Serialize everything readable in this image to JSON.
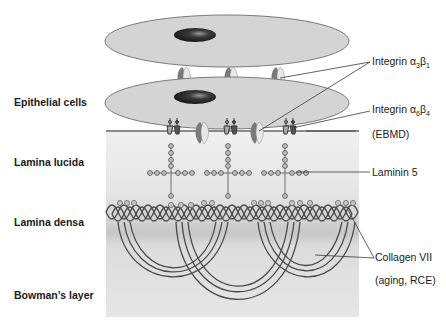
{
  "layers": {
    "epithelial": "Epithelial cells",
    "lucida": "Lamina lucida",
    "densa": "Lamina densa",
    "bowman": "Bowman’s layer"
  },
  "callouts": {
    "integrin_a3b1": {
      "prefix": "Integrin ",
      "alpha": "α",
      "alpha_sub": "3",
      "beta": "β",
      "beta_sub": "1"
    },
    "integrin_a6b4": {
      "prefix": "Integrin ",
      "alpha": "α",
      "alpha_sub": "6",
      "beta": "β",
      "beta_sub": "4"
    },
    "ebmd": "(EBMD)",
    "laminin": "Laminin 5",
    "collagen": "Collagen VII",
    "collagen_note": "(aging, RCE)"
  },
  "colors": {
    "cell_fill": "#d4d4d4",
    "nucleus": "#2a2a2a",
    "membrane_bg_top": "#efefef",
    "membrane_bg_bottom": "#c6c6c6",
    "strand": "#5a5a5a"
  }
}
